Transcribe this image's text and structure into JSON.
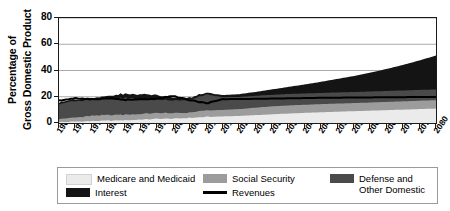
{
  "chart_data": {
    "type": "area",
    "title": "",
    "xlabel": "",
    "ylabel": "Percentage of Gross Domestic Product",
    "ylabel_line1": "Percentage of",
    "ylabel_line2": "Gross Domestic Product",
    "ylim": [
      0,
      80
    ],
    "yticks": [
      0,
      20,
      40,
      60,
      80
    ],
    "xlim": [
      1965,
      2080
    ],
    "grid": true,
    "grid_axis": "y",
    "legend_position": "bottom",
    "stacked": true,
    "categories": [
      1965,
      1970,
      1975,
      1980,
      1985,
      1990,
      1995,
      2000,
      2005,
      2010,
      2015,
      2020,
      2025,
      2030,
      2035,
      2040,
      2045,
      2050,
      2055,
      2060,
      2065,
      2070,
      2075,
      2080
    ],
    "xtick_labels": [
      "1965",
      "1970",
      "1975",
      "1980",
      "1985",
      "1990",
      "1995",
      "2000",
      "2005",
      "2010",
      "2015",
      "2020",
      "2025",
      "2030",
      "2035",
      "2040",
      "2045",
      "2050",
      "2055",
      "2060",
      "2065",
      "2070",
      "2075",
      "2080"
    ],
    "series": [
      {
        "name": "Medicare and Medicaid",
        "color": "#ebebeb",
        "kind": "area",
        "values": [
          0.7,
          1.1,
          1.5,
          1.8,
          2.1,
          2.6,
          3.2,
          3.3,
          3.9,
          4.7,
          5.0,
          5.4,
          6.0,
          6.6,
          7.2,
          7.7,
          8.2,
          8.6,
          9.0,
          9.4,
          9.8,
          10.2,
          10.6,
          11.0
        ]
      },
      {
        "name": "Social Security",
        "color": "#9c9c9c",
        "kind": "area",
        "values": [
          2.5,
          3.0,
          4.0,
          4.3,
          4.3,
          4.3,
          4.5,
          4.1,
          4.1,
          4.8,
          4.9,
          5.2,
          5.7,
          6.1,
          6.2,
          6.2,
          6.2,
          6.2,
          6.2,
          6.2,
          6.3,
          6.3,
          6.4,
          6.4
        ]
      },
      {
        "name": "Defense and Other Domestic",
        "color": "#4a4a4a",
        "kind": "area",
        "values": [
          11.5,
          12.5,
          12.0,
          12.5,
          12.8,
          11.8,
          10.5,
          9.5,
          9.8,
          12.0,
          9.8,
          9.3,
          9.0,
          8.8,
          8.7,
          8.6,
          8.5,
          8.5,
          8.4,
          8.4,
          8.3,
          8.3,
          8.2,
          8.2
        ]
      },
      {
        "name": "Interest",
        "color": "#141414",
        "kind": "area",
        "values": [
          1.3,
          1.4,
          1.5,
          1.9,
          3.1,
          3.2,
          3.2,
          2.3,
          1.5,
          1.4,
          1.6,
          2.1,
          3.0,
          4.1,
          5.4,
          6.9,
          8.5,
          10.3,
          12.2,
          14.4,
          16.8,
          19.5,
          22.5,
          25.8
        ]
      },
      {
        "name": "Revenues",
        "color": "#000000",
        "kind": "line",
        "values": [
          17.0,
          19.0,
          17.9,
          19.0,
          17.7,
          18.0,
          18.4,
          20.6,
          17.3,
          15.1,
          18.2,
          18.3,
          18.4,
          18.6,
          18.8,
          19.0,
          19.2,
          19.3,
          19.4,
          19.5,
          19.6,
          19.7,
          19.8,
          19.9
        ]
      }
    ],
    "legend_entries": [
      {
        "label": "Medicare and Medicaid",
        "color": "#ebebeb",
        "type": "swatch"
      },
      {
        "label": "Social Security",
        "color": "#9c9c9c",
        "type": "swatch"
      },
      {
        "label": "Defense and\nOther Domestic",
        "color": "#4a4a4a",
        "type": "swatch"
      },
      {
        "label": "Interest",
        "color": "#141414",
        "type": "swatch"
      },
      {
        "label": "Revenues",
        "color": "#000000",
        "type": "line"
      }
    ]
  },
  "legend": {
    "medicare_label": "Medicare and Medicaid",
    "social_security_label": "Social Security",
    "defense_label": "Defense and\nOther Domestic",
    "interest_label": "Interest",
    "revenues_label": "Revenues"
  },
  "axes": {
    "ylabel_line1": "Percentage of",
    "ylabel_line2": "Gross Domestic Product"
  }
}
